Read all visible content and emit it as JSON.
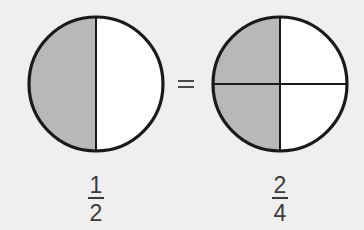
{
  "diagram": {
    "background": "#efefef",
    "shade_color": "#b8b8b8",
    "unshaded_color": "#ffffff",
    "stroke_color": "#1a1a1a",
    "relation_symbol": "=",
    "left": {
      "shape": "circle",
      "parts": 2,
      "shaded_parts": 1,
      "division": "vertical halves",
      "shaded_region": "left half",
      "fraction": {
        "numerator": "1",
        "denominator": "2"
      }
    },
    "right": {
      "shape": "circle",
      "parts": 4,
      "shaded_parts": 2,
      "division": "quarters (vertical and horizontal line)",
      "shaded_region": "left two quarters",
      "fraction": {
        "numerator": "2",
        "denominator": "4"
      }
    }
  }
}
